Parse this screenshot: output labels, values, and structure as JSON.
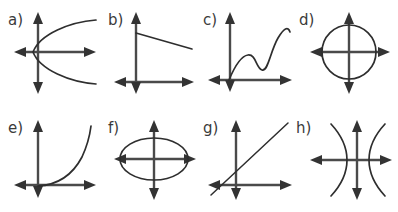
{
  "figure": {
    "background_color": "#ffffff",
    "axis_color": "#4a4a4a",
    "curve_color": "#2e2e2e",
    "label_color": "#3b3b3b",
    "width": 398,
    "height": 212,
    "rows": 2,
    "columns": 4
  },
  "panels": [
    {
      "id": "a",
      "label": "a)",
      "label_x": 8,
      "label_y": 25,
      "curve_name": "sideways-parabola-opening-right",
      "origin_x": 38,
      "origin_y": 52,
      "x_axis": {
        "x1": 14,
        "x2": 96,
        "y": 52
      },
      "y_axis": {
        "y1": 12,
        "y2": 94,
        "x": 38
      },
      "curve_path": "M 96 20 C 70 22 40 34 33 52 C 40 70 70 82 96 84"
    },
    {
      "id": "b",
      "label": "b)",
      "label_x": 108,
      "label_y": 25,
      "curve_name": "line-negative-slope-shallow",
      "origin_x": 136,
      "origin_y": 82,
      "x_axis": {
        "x1": 114,
        "x2": 194,
        "y": 82
      },
      "y_axis": {
        "y1": 12,
        "y2": 94,
        "x": 136
      },
      "curve_path": "M 136 33 L 192 49"
    },
    {
      "id": "c",
      "label": "c)",
      "label_x": 203,
      "label_y": 25,
      "curve_name": "wavy-cubic-increasing",
      "origin_x": 230,
      "origin_y": 80,
      "x_axis": {
        "x1": 208,
        "x2": 292,
        "y": 80
      },
      "y_axis": {
        "y1": 12,
        "y2": 92,
        "x": 230
      },
      "curve_path": "M 229 80 C 234 68 240 56 248 55 C 256 54 256 68 262 70 C 268 72 270 52 278 38 C 284 28 288 26 290 32"
    },
    {
      "id": "d",
      "label": "d)",
      "label_x": 299,
      "label_y": 25,
      "curve_name": "circle",
      "origin_x": 349,
      "origin_y": 52,
      "x_axis": {
        "x1": 310,
        "x2": 390,
        "y": 52
      },
      "y_axis": {
        "y1": 12,
        "y2": 94,
        "x": 349
      },
      "circle": {
        "cx": 349,
        "cy": 52,
        "r": 27
      }
    },
    {
      "id": "e",
      "label": "e)",
      "label_x": 8,
      "label_y": 133,
      "curve_name": "exponential-growth",
      "origin_x": 38,
      "origin_y": 185,
      "x_axis": {
        "x1": 14,
        "x2": 96,
        "y": 185
      },
      "y_axis": {
        "y1": 120,
        "y2": 198,
        "x": 38
      },
      "curve_path": "M 38 186 C 56 185 72 176 82 157 C 88 144 90 134 91 126"
    },
    {
      "id": "f",
      "label": "f)",
      "label_x": 108,
      "label_y": 133,
      "curve_name": "ellipse-horizontal",
      "origin_x": 154,
      "origin_y": 159,
      "x_axis": {
        "x1": 114,
        "x2": 196,
        "y": 159
      },
      "y_axis": {
        "y1": 120,
        "y2": 200,
        "x": 154
      },
      "ellipse": {
        "cx": 154,
        "cy": 159,
        "rx": 34,
        "ry": 21
      }
    },
    {
      "id": "g",
      "label": "g)",
      "label_x": 203,
      "label_y": 133,
      "curve_name": "line-positive-slope",
      "origin_x": 236,
      "origin_y": 185,
      "x_axis": {
        "x1": 208,
        "x2": 292,
        "y": 185
      },
      "y_axis": {
        "y1": 120,
        "y2": 200,
        "x": 236
      },
      "curve_path": "M 211 195 L 288 123"
    },
    {
      "id": "h",
      "label": "h)",
      "label_x": 296,
      "label_y": 133,
      "curve_name": "hyperbola-horizontal",
      "origin_x": 357,
      "origin_y": 160,
      "x_axis": {
        "x1": 310,
        "x2": 392,
        "y": 160
      },
      "y_axis": {
        "y1": 120,
        "y2": 200,
        "x": 357
      },
      "curve_path_left": "M 331 124 C 344 138 347 150 347 160 C 347 170 344 182 331 196",
      "curve_path_right": "M 385 124 C 372 138 369 150 369 160 C 369 170 372 182 385 196"
    }
  ]
}
